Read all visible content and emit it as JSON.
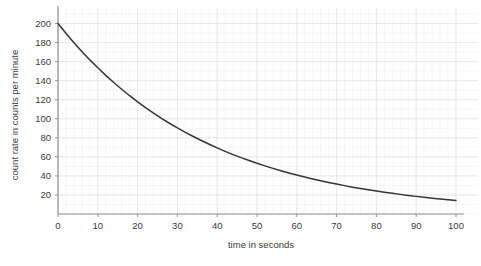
{
  "chart_data": {
    "type": "line",
    "title": "",
    "xlabel": "time in seconds",
    "ylabel": "count rate in counts per minute",
    "xlim": [
      0,
      100
    ],
    "ylim": [
      0,
      210
    ],
    "grid": true,
    "legend": "none",
    "xticks": [
      0,
      10,
      20,
      30,
      40,
      50,
      60,
      70,
      80,
      90,
      100
    ],
    "yticks": [
      20,
      40,
      60,
      80,
      100,
      120,
      140,
      160,
      180,
      200
    ],
    "xtick_labels": [
      "0",
      "10",
      "20",
      "30",
      "40",
      "50",
      "60",
      "70",
      "80",
      "90",
      "100"
    ],
    "ytick_labels": [
      "20",
      "40",
      "60",
      "80",
      "100",
      "120",
      "140",
      "160",
      "180",
      "200"
    ],
    "series": [
      {
        "name": "count rate",
        "color": "#353535",
        "x": [
          0,
          2,
          4,
          6,
          8,
          10,
          12,
          14,
          16,
          18,
          20,
          22,
          24,
          26,
          28,
          30,
          32,
          34,
          36,
          38,
          40,
          42,
          44,
          46,
          48,
          50,
          52,
          54,
          56,
          58,
          60,
          62,
          64,
          66,
          68,
          70,
          72,
          74,
          76,
          78,
          80,
          82,
          84,
          86,
          88,
          90,
          92,
          94,
          96,
          98,
          100
        ],
        "values": [
          200.0,
          189.7,
          179.9,
          170.6,
          161.8,
          153.5,
          145.6,
          138.1,
          131.0,
          124.2,
          117.8,
          111.7,
          106.0,
          100.5,
          95.3,
          90.4,
          85.8,
          81.4,
          77.2,
          73.2,
          69.4,
          65.8,
          62.4,
          59.2,
          56.2,
          53.3,
          50.5,
          47.9,
          45.4,
          43.1,
          40.9,
          38.8,
          36.8,
          34.9,
          33.1,
          31.4,
          29.8,
          28.2,
          26.8,
          25.4,
          24.1,
          22.9,
          21.7,
          20.6,
          19.5,
          18.5,
          17.5,
          16.6,
          15.8,
          15.0,
          14.2
        ]
      }
    ]
  }
}
